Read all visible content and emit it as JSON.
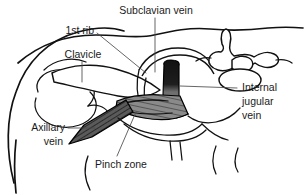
{
  "figure": {
    "background_color": "#ffffff",
    "line_color": "#111111",
    "text_color": "#1a1a1a"
  },
  "labels": {
    "subclavian_vein": "Subclavian vein",
    "first_rib": "1st rib",
    "clavicle": "Clavicle",
    "internal_jugular_line1": "Internal",
    "internal_jugular_line2": "jugular",
    "internal_jugular_line3": "vein",
    "axillary_line1": "Axillary",
    "axillary_line2": "vein",
    "pinch_zone": "Pinch zone"
  },
  "structures": {
    "internal_jugular_vein": {
      "name": "internal-jugular-vein",
      "shade": "#1b1b1b"
    },
    "subclavian_vein": {
      "name": "subclavian-vein",
      "shade": "#777777"
    },
    "axillary_vein": {
      "name": "axillary-vein",
      "shade": "#5a5a5a"
    },
    "clavicle_bone": {
      "name": "clavicle-bone",
      "shade": "#ffffff"
    },
    "first_rib_bone": {
      "name": "first-rib-bone",
      "shade": "#ffffff"
    },
    "vertebra": {
      "name": "cervical-vertebra",
      "shade": "#ffffff"
    },
    "body_outline": {
      "name": "body-outline",
      "shade": "none"
    }
  }
}
